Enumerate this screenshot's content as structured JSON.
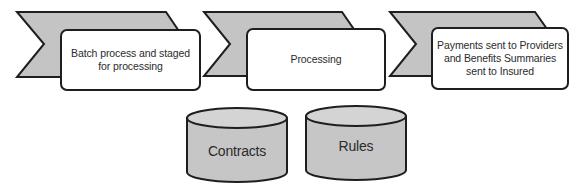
{
  "colors": {
    "chevron_fill": "#c4c4c4",
    "box_fill": "#ffffff",
    "cylinder_fill": "#c6c6c6",
    "cylinder_top_fill": "#d4d4d4",
    "stroke": "#1e1e1e",
    "text": "#2b2b2b"
  },
  "process_steps": [
    {
      "label": "Batch process and staged for processing"
    },
    {
      "label": "Processing"
    },
    {
      "label": "Payments sent to Providers and Benefits Summaries sent to Insured"
    }
  ],
  "data_stores": [
    {
      "label": "Contracts"
    },
    {
      "label": "Rules"
    }
  ]
}
